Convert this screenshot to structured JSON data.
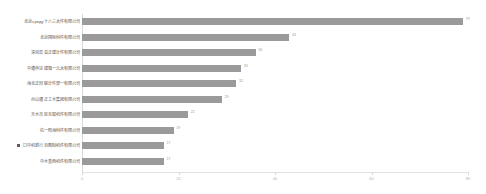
{
  "chart_data": {
    "type": "bar",
    "orientation": "horizontal",
    "title": "",
    "xlabel": "",
    "ylabel": "",
    "xlim": [
      0,
      80
    ],
    "grid": false,
    "legend": false,
    "bar_color": "#9a9a9a",
    "axis_color": "#d9d9d9",
    "tick_label_color": "#b4b4b4",
    "category_label_color": "#555555",
    "value_label_color": "#9b9b9b",
    "xticks": [
      0,
      20,
      40,
      60,
      80
    ],
    "xticklabels": [
      "0",
      "20",
      "40",
      "60",
      "80"
    ],
    "categories": [
      "北京среду十八三大件有限公司",
      "北京国际科件有限公司",
      "深圳高音正建计件有限公司",
      "中通申达建箱一元大有限公司",
      "海北正同联计件部一有限公司",
      "示山通正工水集团有限公司",
      "天水市区互取机件有限公司",
      "杭一阳海科件有限公司",
      "口中机新行百图制机件有限公司",
      "中水重西机件有限公司"
    ],
    "values": [
      79,
      43,
      36,
      33,
      32,
      29,
      22,
      19,
      17,
      17
    ],
    "value_labels": [
      "79",
      "43",
      "36",
      "33",
      "32",
      "29",
      "22",
      "19",
      "17",
      "17"
    ],
    "highlighted_index": 8,
    "highlight_marker": "square-marker"
  }
}
